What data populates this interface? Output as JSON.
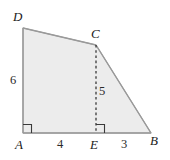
{
  "figure": {
    "kind": "geometry-diagram",
    "canvas": {
      "width": 170,
      "height": 160
    },
    "colors": {
      "background": "#ffffff",
      "fill": "#ececec",
      "stroke": "#9a9a9a",
      "dash": "#2a2a2a",
      "label": "#1a1a1a",
      "measure": "#2a2a2a"
    },
    "polygon": {
      "name": "ABCD",
      "points": "23,133 151,133 96,45 23,28"
    },
    "vertices": [
      {
        "id": "A",
        "label": "A",
        "x": 23,
        "y": 133
      },
      {
        "id": "B",
        "label": "B",
        "x": 151,
        "y": 133
      },
      {
        "id": "C",
        "label": "C",
        "x": 96,
        "y": 45
      },
      {
        "id": "D",
        "label": "D",
        "x": 23,
        "y": 28
      },
      {
        "id": "E",
        "label": "E",
        "x": 96,
        "y": 133
      }
    ],
    "segments": [
      {
        "id": "AD",
        "from": "A",
        "to": "D",
        "style": "solid"
      },
      {
        "id": "DC",
        "from": "D",
        "to": "C",
        "style": "solid"
      },
      {
        "id": "CB",
        "from": "C",
        "to": "B",
        "style": "solid"
      },
      {
        "id": "AB",
        "from": "A",
        "to": "B",
        "style": "solid"
      },
      {
        "id": "CE",
        "from": "C",
        "to": "E",
        "style": "dashed"
      }
    ],
    "right_angles": [
      {
        "id": "angle-A",
        "at": "A",
        "x": 23,
        "y": 133
      },
      {
        "id": "angle-E",
        "at": "E",
        "x": 96,
        "y": 133
      }
    ],
    "measures": [
      {
        "id": "AD",
        "segment": "AD",
        "value": "6"
      },
      {
        "id": "AE",
        "segment": "AE",
        "value": "4"
      },
      {
        "id": "CE",
        "segment": "CE",
        "value": "5"
      },
      {
        "id": "EB",
        "segment": "EB",
        "value": "3"
      }
    ]
  }
}
